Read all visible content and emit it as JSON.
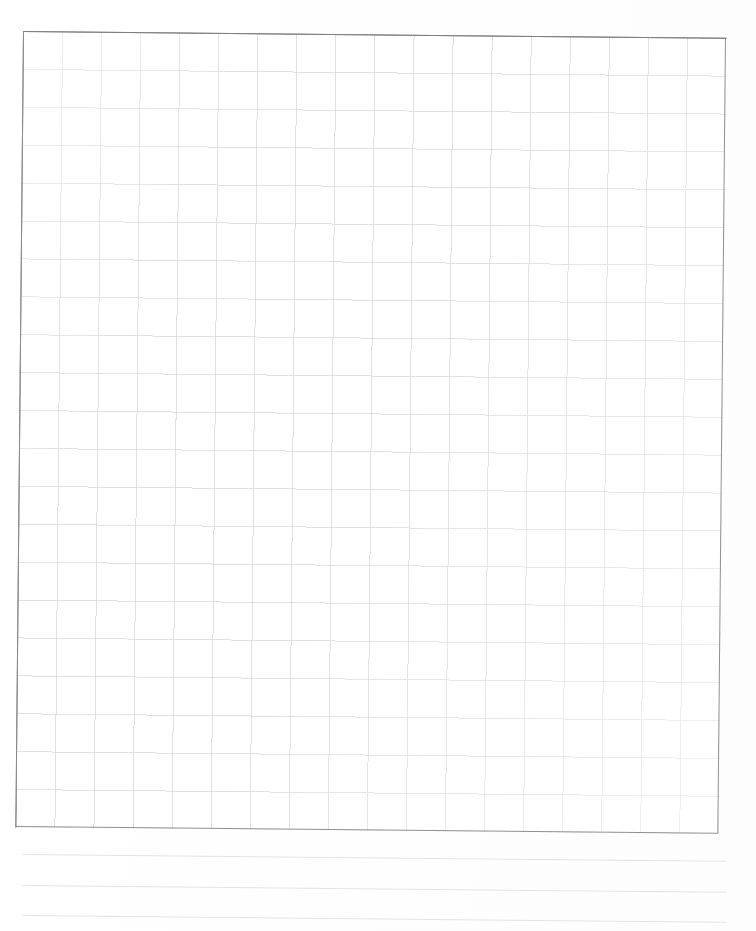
{
  "page": {
    "kind": "blank-grid-worksheet",
    "width": 756,
    "height": 931,
    "background_color": "#ffffff",
    "rotation_degrees": 0.55,
    "visible_text": ""
  },
  "grid": {
    "name": "graph-paper-grid",
    "columns": 18,
    "rows": 21,
    "cell_width_px": 39,
    "cell_height_px": 38,
    "left_px": 23,
    "top_px": 31,
    "width_px": 703,
    "height_px": 796,
    "line_color": "#dfe0e0",
    "border_color": "#8f9090",
    "border_width_px": 1,
    "fill_color": "#ffffff"
  },
  "ruled_lines": {
    "name": "writing-rules",
    "count": 3,
    "color": "#e3e4e5",
    "left_px": 22,
    "width_px": 704,
    "items": [
      {
        "label": "rule-1",
        "top_px": 854
      },
      {
        "label": "rule-2",
        "top_px": 885
      },
      {
        "label": "rule-3",
        "top_px": 915
      }
    ]
  },
  "chart_data": {
    "type": "table",
    "title": "",
    "subtitle": "",
    "xlabel": "",
    "ylabel": "",
    "grid": true,
    "legend": "none",
    "columns": 18,
    "rows": 21,
    "categories": [],
    "values": [],
    "annotations": []
  }
}
